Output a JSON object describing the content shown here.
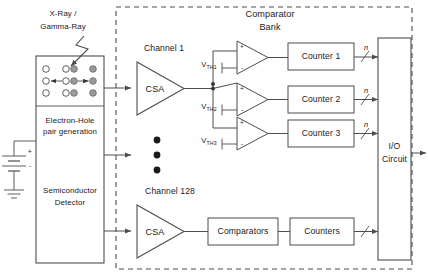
{
  "figure": {
    "type": "block-diagram"
  },
  "source": {
    "radiation_label": "X-Ray /\nGamma-Ray",
    "radiation_label_line1": "X-Ray /",
    "radiation_label_line2": "Gamma-Ray"
  },
  "detector": {
    "interaction_label_line1": "Electron-Hole",
    "interaction_label_line2": "pair generation",
    "interaction_label": "Electron-Hole\npair generation",
    "name_line1": "Semiconductor",
    "name_line2": "Detector",
    "name": "Semiconductor\nDetector",
    "bias": {
      "plus": "+",
      "minus": "-"
    },
    "carriers": {
      "electron_fill": "#ffffff",
      "hole_fill": "#9a9a9a",
      "columns": 3,
      "rows": 3
    }
  },
  "asic": {
    "bank_title_line1": "Comparator",
    "bank_title_line2": "Bank",
    "bank_title": "Comparator Bank"
  },
  "channels": [
    {
      "name": "Channel 1",
      "amplifier": "CSA",
      "comparators": [
        {
          "threshold": "V",
          "threshold_sub": "TH1",
          "plus": "+",
          "minus": "-"
        },
        {
          "threshold": "V",
          "threshold_sub": "TH2",
          "plus": "+",
          "minus": "-"
        },
        {
          "threshold": "V",
          "threshold_sub": "TH3",
          "plus": "+",
          "minus": "-"
        }
      ],
      "counters": [
        "Counter 1",
        "Counter 2",
        "Counter 3"
      ],
      "bus_labels": [
        "n",
        "n",
        "n"
      ]
    },
    {
      "name": "Channel 128",
      "amplifier": "CSA",
      "comparators_block": "Comparators",
      "counters_block": "Counters",
      "bus_labels": [
        ""
      ]
    }
  ],
  "ellipsis": {
    "dots": 3
  },
  "io": {
    "label_line1": "I/O",
    "label_line2": "Circuit",
    "label": "I/O Circuit"
  },
  "colors": {
    "line": "#4d4d4d",
    "text": "#1a1a1a",
    "background": "#ffffff",
    "dashed_border": "#4d4d4d",
    "hole": "#9a9a9a",
    "electron": "#ffffff"
  }
}
